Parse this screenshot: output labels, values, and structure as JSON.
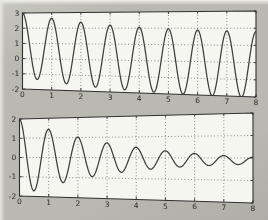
{
  "palette": {
    "page_background": "#b9b9b1",
    "page_edge_highlight": "#eeeee8",
    "plot_background": "#f6f6f0",
    "frame_color": "#2f2f2f",
    "grid_color": "#686868",
    "curve_color": "#3d3d3d",
    "label_color": "#2b2b2b"
  },
  "chart_data": [
    {
      "type": "line",
      "title": "",
      "xlabel": "",
      "ylabel": "",
      "xlim": [
        0,
        8
      ],
      "ylim": [
        -2,
        3
      ],
      "x_ticks": [
        0,
        1,
        2,
        3,
        4,
        5,
        6,
        7,
        8
      ],
      "x_tick_labels": [
        "0",
        "1",
        "2",
        "3",
        "4",
        "5",
        "6",
        "7",
        "8"
      ],
      "y_ticks": [
        3,
        2,
        1,
        0,
        -1,
        -2
      ],
      "y_tick_labels": [
        "3",
        "2",
        "1",
        "0",
        "-1",
        "-2"
      ],
      "grid": "dotted",
      "legend": "none",
      "series": [
        {
          "name": "lightly-damped-oscillation",
          "model": {
            "base": -0.2,
            "drift": 0,
            "offset_amp": 1.1,
            "offset_tau": 3,
            "amp_base": 1.9,
            "amp_var": 0.2,
            "amp_tau": 4,
            "decay": 0,
            "freq": 1,
            "phase": 0,
            "t_step": 0.02
          },
          "peaks_t": [
            0,
            1,
            2,
            3,
            4,
            5,
            6,
            7,
            8
          ],
          "peaks_y": [
            3.0,
            2.64,
            2.39,
            2.2,
            2.06,
            1.97,
            1.89,
            1.84,
            1.8
          ],
          "troughs_t": [
            0.5,
            1.5,
            2.5,
            3.5,
            4.5,
            5.5,
            6.5,
            7.5
          ],
          "troughs_y": [
            -1.35,
            -1.57,
            -1.73,
            -1.84,
            -1.92,
            -1.98,
            -2.02,
            -2.04
          ]
        }
      ]
    },
    {
      "type": "line",
      "title": "",
      "xlabel": "",
      "ylabel": "",
      "xlim": [
        0,
        8
      ],
      "ylim": [
        -2,
        2
      ],
      "x_ticks": [
        0,
        1,
        2,
        3,
        4,
        5,
        6,
        7,
        8
      ],
      "x_tick_labels": [
        "0",
        "1",
        "2",
        "3",
        "4",
        "5",
        "6",
        "7",
        "8"
      ],
      "y_ticks": [
        2,
        1,
        0,
        -1,
        -2
      ],
      "y_tick_labels": [
        "2",
        "1",
        "0",
        "-1",
        "-2"
      ],
      "grid": "dotted",
      "legend": "none",
      "series": [
        {
          "name": "strongly-damped-oscillation",
          "model": {
            "base": 0,
            "drift": -0.015,
            "offset_amp": 0,
            "offset_tau": 1,
            "amp_base": 2.0,
            "amp_var": 0,
            "amp_tau": 1,
            "decay": 0.32,
            "freq": 1,
            "phase": 0,
            "t_step": 0.02
          },
          "peaks_t": [
            0,
            1,
            2,
            3,
            4,
            5,
            6,
            7,
            8
          ],
          "peaks_y": [
            2.0,
            1.44,
            1.03,
            0.72,
            0.5,
            0.33,
            0.2,
            0.11,
            0.03
          ],
          "troughs_t": [
            0.5,
            1.5,
            2.5,
            3.5,
            4.5,
            5.5,
            6.5,
            7.5
          ],
          "troughs_y": [
            -1.71,
            -1.26,
            -0.94,
            -0.71,
            -0.54,
            -0.43,
            -0.35,
            -0.29
          ]
        }
      ]
    }
  ]
}
